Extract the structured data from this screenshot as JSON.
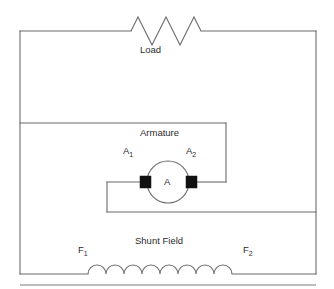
{
  "diagram": {
    "type": "electrical-schematic",
    "canvas": {
      "width": 334,
      "height": 289
    },
    "colors": {
      "wire": "#6b6b6b",
      "brush": "#111111",
      "text": "#2b2b2b",
      "background": "#ffffff",
      "rule": "#7a7a7a"
    },
    "labels": {
      "load": "Load",
      "armature": "Armature",
      "armature_terminal_1": "A",
      "armature_terminal_1_sub": "1",
      "armature_terminal_2": "A",
      "armature_terminal_2_sub": "2",
      "armature_core": "A",
      "shunt_field": "Shunt Field",
      "field_terminal_1": "F",
      "field_terminal_1_sub": "1",
      "field_terminal_2": "F",
      "field_terminal_2_sub": "2"
    },
    "components": {
      "load_resistor": {
        "name": "Load",
        "symbol": "zigzag-resistor",
        "peaks": 3
      },
      "shunt_field_coil": {
        "name": "Shunt Field",
        "symbol": "arc-coil-inductor",
        "humps": 8
      },
      "armature": {
        "name": "Armature",
        "symbol": "circle-with-brushes",
        "inner_letter": "A",
        "brush_count": 2
      }
    }
  }
}
